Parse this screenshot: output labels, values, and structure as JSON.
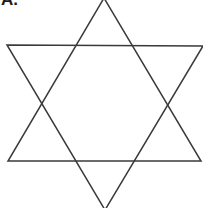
{
  "figure": {
    "label": "A.",
    "shape": "hexagram",
    "stroke_color": "#3a3a3a",
    "background": "#ffffff",
    "triangles": [
      {
        "name": "upward-triangle",
        "points": "104,-2 8,161 201,161"
      },
      {
        "name": "downward-triangle",
        "points": "7,45 203,46 105,210"
      }
    ]
  }
}
